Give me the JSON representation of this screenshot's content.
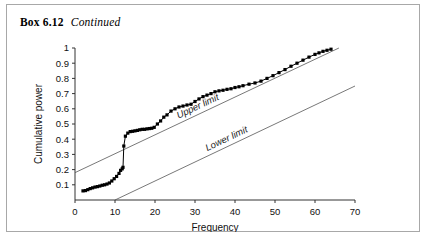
{
  "box": {
    "number_label": "Box 6.12",
    "continued_label": "Continued"
  },
  "chart_data": {
    "type": "line",
    "title": "",
    "xlabel": "Frequency",
    "ylabel": "Cumulative power",
    "xlim": [
      0,
      70
    ],
    "ylim": [
      0,
      1
    ],
    "xticks": [
      0,
      10,
      20,
      30,
      40,
      50,
      60,
      70
    ],
    "xtick_labels": [
      "0",
      "10",
      "20",
      "30",
      "40",
      "50",
      "60",
      "70"
    ],
    "yticks": [
      0.1,
      0.2,
      0.3,
      0.4,
      0.5,
      0.6,
      0.7,
      0.8,
      0.9,
      1
    ],
    "ytick_labels": [
      "0.1",
      "0.2",
      "0.3",
      "0.4",
      "0.5",
      "0.6",
      "0.7",
      "0.8",
      "0.9",
      "1"
    ],
    "grid": false,
    "legend_position": "inline-annotation",
    "marker": "filled-square",
    "marker_color": "#000000",
    "line_color": "#000000",
    "limit_line_color": "#555555",
    "series": [
      {
        "name": "Cumulative power",
        "x": [
          2.0,
          2.6,
          3.2,
          3.8,
          4.4,
          5.0,
          5.6,
          6.2,
          6.8,
          7.4,
          8.0,
          8.6,
          9.2,
          9.8,
          10.4,
          11.0,
          11.4,
          11.8,
          12.0,
          12.2,
          12.6,
          13.2,
          13.8,
          14.4,
          15.0,
          15.6,
          16.2,
          16.8,
          17.4,
          18.0,
          18.6,
          19.2,
          19.8,
          20.6,
          21.4,
          22.2,
          23.0,
          24.0,
          25.0,
          26.0,
          27.0,
          28.0,
          29.0,
          30.0,
          31.0,
          32.0,
          33.0,
          34.0,
          35.0,
          36.0,
          37.0,
          38.0,
          39.0,
          40.0,
          41.0,
          42.0,
          43.5,
          45.0,
          46.5,
          48.0,
          49.5,
          51.0,
          52.5,
          54.0,
          55.5,
          57.0,
          58.5,
          60.0,
          61.0,
          62.0,
          63.0,
          64.0
        ],
        "y": [
          0.06,
          0.062,
          0.068,
          0.075,
          0.08,
          0.085,
          0.088,
          0.092,
          0.097,
          0.1,
          0.105,
          0.112,
          0.125,
          0.14,
          0.155,
          0.175,
          0.195,
          0.205,
          0.215,
          0.355,
          0.42,
          0.44,
          0.45,
          0.452,
          0.455,
          0.458,
          0.462,
          0.465,
          0.465,
          0.468,
          0.47,
          0.472,
          0.478,
          0.5,
          0.52,
          0.545,
          0.56,
          0.585,
          0.6,
          0.612,
          0.618,
          0.625,
          0.63,
          0.648,
          0.665,
          0.68,
          0.69,
          0.7,
          0.712,
          0.718,
          0.722,
          0.728,
          0.732,
          0.74,
          0.745,
          0.752,
          0.762,
          0.77,
          0.782,
          0.8,
          0.818,
          0.838,
          0.858,
          0.88,
          0.9,
          0.92,
          0.94,
          0.958,
          0.968,
          0.978,
          0.985,
          0.992
        ]
      }
    ],
    "limit_lines": [
      {
        "name": "Upper limit",
        "label": "Upper limit",
        "x": [
          0,
          70
        ],
        "y": [
          0.18,
          1.05
        ]
      },
      {
        "name": "Lower limit",
        "label": "Lower limit",
        "x": [
          10,
          70
        ],
        "y": [
          0.0,
          0.75
        ]
      }
    ]
  }
}
